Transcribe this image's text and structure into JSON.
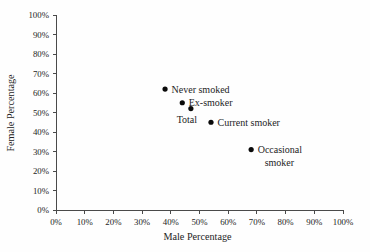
{
  "figure": {
    "background": "#fefefe",
    "text_color": "#242424",
    "axis_color": "#4a4a4a",
    "marker_color": "#0a0a0a"
  },
  "chart_data": {
    "type": "scatter",
    "title": "",
    "xlabel": "Male Percentage",
    "ylabel": "Female Percentage",
    "xlim": [
      0,
      100
    ],
    "ylim": [
      0,
      100
    ],
    "xticks": [
      "0%",
      "10%",
      "20%",
      "30%",
      "40%",
      "50%",
      "60%",
      "70%",
      "80%",
      "90%",
      "100%"
    ],
    "yticks": [
      "0%",
      "10%",
      "20%",
      "30%",
      "40%",
      "50%",
      "60%",
      "70%",
      "80%",
      "90%",
      "100%"
    ],
    "grid": false,
    "legend": "none",
    "points": [
      {
        "label": "Never smoked",
        "x": 38,
        "y": 62,
        "label_pos": "right"
      },
      {
        "label": "Ex-smoker",
        "x": 44,
        "y": 55,
        "label_pos": "right"
      },
      {
        "label": "Total",
        "x": 47,
        "y": 52,
        "label_pos": "below-left"
      },
      {
        "label": "Current smoker",
        "x": 54,
        "y": 45,
        "label_pos": "right"
      },
      {
        "label": "Occasional smoker",
        "x": 68,
        "y": 31,
        "label_pos": "right",
        "label_lines": [
          "Occasional",
          "smoker"
        ]
      }
    ]
  }
}
